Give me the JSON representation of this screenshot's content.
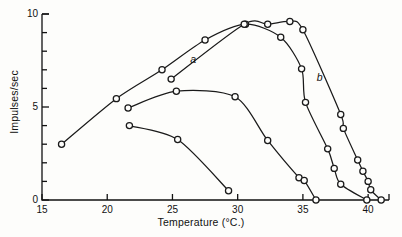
{
  "chart_data": {
    "type": "line",
    "title": "",
    "xlabel": "Temperature (°C.)",
    "ylabel": "Impulses/sec",
    "xlim": [
      15,
      41.6
    ],
    "ylim": [
      0,
      10
    ],
    "xticks": [
      15,
      20,
      25,
      30,
      35,
      40
    ],
    "xticklabels": [
      "15",
      "20",
      "25",
      "30",
      "35",
      "40"
    ],
    "yticks": [
      0,
      1,
      2,
      3,
      4,
      5,
      6,
      7,
      8,
      9,
      10
    ],
    "yticklabels_shown": [
      "0",
      "5",
      "10"
    ],
    "grid": false,
    "legend": "inline-curve-labels",
    "marker": "open-circle",
    "line_color": "#1a1a1a",
    "annotations": [
      {
        "text": "a",
        "x": 26.6,
        "y": 7.55
      },
      {
        "text": "b",
        "x": 36.3,
        "y": 6.55
      }
    ],
    "series": [
      {
        "name": "curve-1-lowest",
        "points": [
          {
            "x": 21.7,
            "y": 4.0
          },
          {
            "x": 25.4,
            "y": 3.25
          },
          {
            "x": 29.3,
            "y": 0.5
          }
        ]
      },
      {
        "name": "curve-2-middle",
        "points": [
          {
            "x": 21.6,
            "y": 4.95
          },
          {
            "x": 25.3,
            "y": 5.85
          },
          {
            "x": 29.8,
            "y": 5.55
          },
          {
            "x": 32.3,
            "y": 3.2
          },
          {
            "x": 34.7,
            "y": 1.2
          },
          {
            "x": 35.1,
            "y": 1.05
          },
          {
            "x": 36.0,
            "y": 0.0
          }
        ]
      },
      {
        "name": "curve-3-a",
        "points": [
          {
            "x": 16.5,
            "y": 3.0
          },
          {
            "x": 20.7,
            "y": 5.45
          },
          {
            "x": 24.2,
            "y": 7.0
          },
          {
            "x": 27.5,
            "y": 8.6
          },
          {
            "x": 30.6,
            "y": 9.45
          },
          {
            "x": 33.3,
            "y": 8.75
          },
          {
            "x": 34.9,
            "y": 7.05
          },
          {
            "x": 35.2,
            "y": 5.25
          },
          {
            "x": 36.9,
            "y": 2.75
          },
          {
            "x": 37.4,
            "y": 1.7
          },
          {
            "x": 37.9,
            "y": 0.85
          },
          {
            "x": 39.9,
            "y": 0.0
          }
        ]
      },
      {
        "name": "curve-4-b",
        "points": [
          {
            "x": 24.9,
            "y": 6.5
          },
          {
            "x": 30.5,
            "y": 9.45
          },
          {
            "x": 32.3,
            "y": 9.45
          },
          {
            "x": 34.0,
            "y": 9.6
          },
          {
            "x": 35.0,
            "y": 9.15
          },
          {
            "x": 37.9,
            "y": 4.6
          },
          {
            "x": 38.1,
            "y": 3.85
          },
          {
            "x": 39.2,
            "y": 2.15
          },
          {
            "x": 39.6,
            "y": 1.55
          },
          {
            "x": 40.0,
            "y": 1.0
          },
          {
            "x": 40.2,
            "y": 0.55
          },
          {
            "x": 41.0,
            "y": 0.0
          }
        ]
      }
    ]
  }
}
